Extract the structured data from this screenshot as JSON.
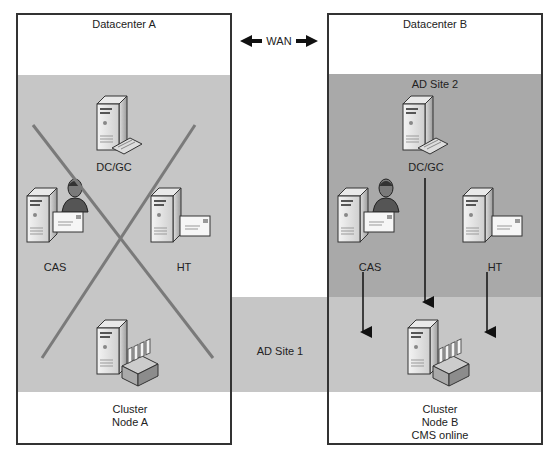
{
  "diagram": {
    "wan_label": "WAN",
    "datacenters": [
      {
        "title": "Datacenter A",
        "servers": [
          {
            "role": "dc-gc",
            "label": "DC/GC",
            "icon": "server-keyboard-icon"
          },
          {
            "role": "cas",
            "label": "CAS",
            "icon": "server-user-mail-icon"
          },
          {
            "role": "ht",
            "label": "HT",
            "icon": "server-mail-icon"
          },
          {
            "role": "cluster",
            "label_line1": "Cluster",
            "label_line2": "Node A",
            "icon": "server-mailbox-icon"
          }
        ],
        "status": "failed (crossed out)"
      },
      {
        "title": "Datacenter B",
        "site_label": "AD Site 2",
        "servers": [
          {
            "role": "dc-gc",
            "label": "DC/GC",
            "icon": "server-keyboard-icon"
          },
          {
            "role": "cas",
            "label": "CAS",
            "icon": "server-user-mail-icon"
          },
          {
            "role": "ht",
            "label": "HT",
            "icon": "server-mail-icon"
          },
          {
            "role": "cluster",
            "label_line1": "Cluster",
            "label_line2": "Node B",
            "label_line3": "CMS online",
            "icon": "server-mailbox-icon"
          }
        ]
      }
    ],
    "site1_label": "AD Site 1",
    "colors": {
      "site1": "#c6c6c6",
      "site2": "#a9a9a9",
      "border": "#333333",
      "cross": "#7a7a7a"
    }
  }
}
